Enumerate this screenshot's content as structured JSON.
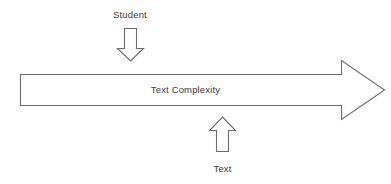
{
  "diagram": {
    "type": "process-arrow-diagram",
    "background_color": "#ffffff",
    "stroke_color": "#6b6b6b",
    "text_color": "#3a3a3a",
    "main_arrow": {
      "label": "Text Complexity",
      "direction": "right",
      "name": "text-complexity-arrow"
    },
    "inputs": [
      {
        "label": "Student",
        "arrow_direction": "down",
        "position": "above",
        "name": "student-input"
      },
      {
        "label": "Text",
        "arrow_direction": "up",
        "position": "below",
        "name": "text-input"
      }
    ]
  }
}
